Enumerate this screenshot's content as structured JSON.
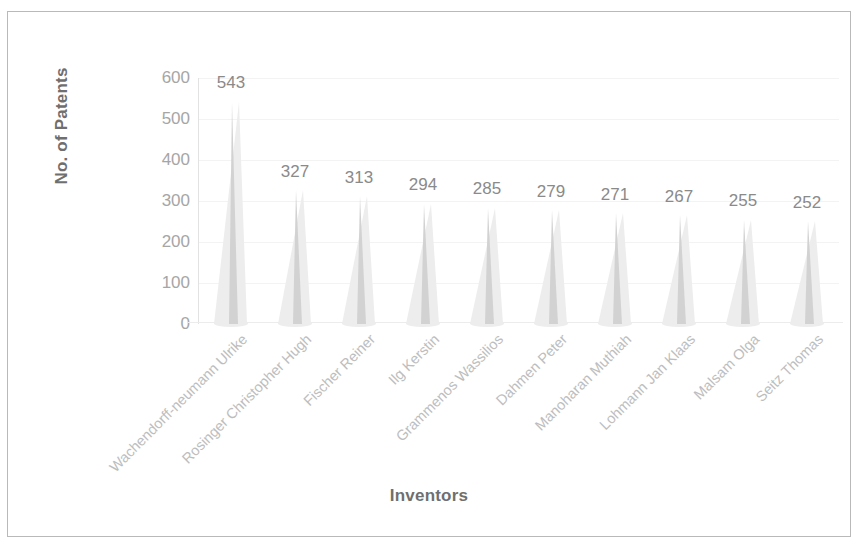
{
  "chart_data": {
    "type": "bar",
    "title": "",
    "xlabel": "Inventors",
    "ylabel": "No. of Patents",
    "categories": [
      "Wachendorff-neumann Ulrike",
      "Rosinger Christopher Hugh",
      "Fischer Reiner",
      "Ilg Kerstin",
      "Grammenos Wassilios",
      "Dahmen Peter",
      "Manoharan Muthiah",
      "Lohmann Jan Klaas",
      "Malsam Olga",
      "Seitz Thomas"
    ],
    "values": [
      543,
      327,
      313,
      294,
      285,
      279,
      271,
      267,
      255,
      252
    ],
    "y_ticks": [
      0,
      100,
      200,
      300,
      400,
      500,
      600
    ],
    "ylim": [
      0,
      600
    ],
    "grid": true,
    "legend": false,
    "data_labels": [
      "543",
      "327",
      "313",
      "294",
      "285",
      "279",
      "271",
      "267",
      "255",
      "252"
    ],
    "bar_style": "3d-cone",
    "bar_color": "#ededed",
    "bar_shade_color": "#d2d2d2",
    "text_color": "#a6a6a6",
    "axis_title_color": "#6f6f6f",
    "grid_color": "#f3f3f3",
    "border_color": "#b9b9b9"
  }
}
